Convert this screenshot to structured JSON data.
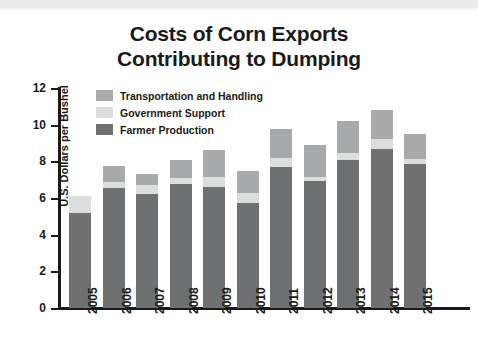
{
  "chart_data": {
    "type": "bar",
    "subtype": "stacked-bar",
    "title": "Costs of Corn Exports Contributing to Dumping",
    "title_lines": [
      "Costs of Corn Exports",
      "Contributing to Dumping"
    ],
    "xlabel": "",
    "ylabel": "U.S. Dollars per Bushel",
    "ylim": [
      0,
      12
    ],
    "yticks": [
      0,
      2,
      4,
      6,
      8,
      10,
      12
    ],
    "ytick_labels": [
      "0",
      "2",
      "4",
      "6",
      "8",
      "10",
      "12"
    ],
    "grid": false,
    "legend_position": "upper-left-inside",
    "categories": [
      "2005",
      "2006",
      "2007",
      "2008",
      "2009",
      "2010",
      "2011",
      "2012",
      "2013",
      "2014",
      "2015"
    ],
    "series": [
      {
        "name": "Farmer Production",
        "color": "#6e7072",
        "values": [
          5.2,
          6.55,
          6.2,
          6.75,
          6.6,
          5.75,
          7.7,
          6.95,
          8.1,
          8.65,
          7.85
        ]
      },
      {
        "name": "Government Support",
        "color": "#dcdddd",
        "values": [
          0.9,
          0.35,
          0.5,
          0.35,
          0.55,
          0.5,
          0.5,
          0.2,
          0.35,
          0.55,
          0.3
        ]
      },
      {
        "name": "Transportation and Handling",
        "color": "#a7a9ab",
        "values": [
          0.0,
          0.85,
          0.6,
          0.95,
          1.45,
          1.2,
          1.55,
          1.75,
          1.75,
          1.6,
          1.35
        ]
      }
    ],
    "totals": [
      6.1,
      7.75,
      7.3,
      8.05,
      8.6,
      7.45,
      9.75,
      8.9,
      10.2,
      10.8,
      9.5
    ]
  },
  "legend": {
    "items": [
      {
        "label": "Transportation and Handling",
        "color": "#a7a9ab"
      },
      {
        "label": "Government Support",
        "color": "#dcdddd"
      },
      {
        "label": "Farmer Production",
        "color": "#6e7072"
      }
    ]
  },
  "colors": {
    "farmer": "#6e7072",
    "government": "#dcdddd",
    "transportation": "#a7a9ab",
    "axis": "#1a1a1a",
    "background": "#ffffff",
    "top_band": "#e9eaea"
  }
}
